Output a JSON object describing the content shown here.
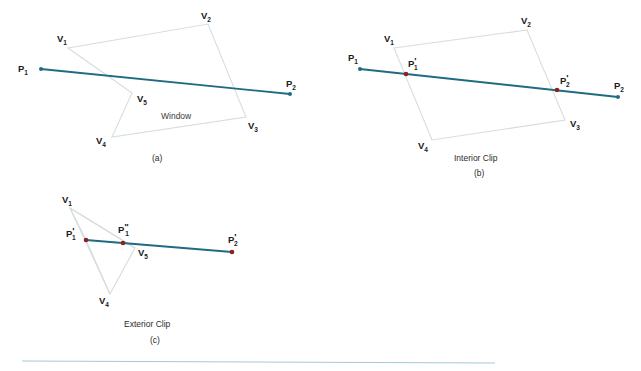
{
  "figure": {
    "colors": {
      "polygon_edge": "#d5dde0",
      "segment": "#1f6b84",
      "endpoint_dot": "#1f6b84",
      "clip_dot": "#8e2020",
      "rule_line": "#a8c6d8",
      "label_text": "#1a1a1a",
      "caption_text": "#2b2b2b",
      "background": "#ffffff"
    },
    "panels": [
      {
        "id": "panel-a",
        "caption": "(a)",
        "title": "",
        "window_label": "Window",
        "vertex_labels": [
          "V",
          "V",
          "V",
          "V",
          "V"
        ],
        "vertex_subscripts": [
          "1",
          "2",
          "3",
          "4",
          "5"
        ],
        "point_labels": [
          "P",
          "P"
        ],
        "point_subscripts": [
          "1",
          "2"
        ],
        "polygon_points": "68,48 208,24 246,117 112,137 132,93",
        "segment": {
          "x1": 41,
          "y1": 69,
          "x2": 290,
          "y2": 94
        }
      },
      {
        "id": "panel-b",
        "caption": "(b)",
        "title": "Interior Clip",
        "window_label": "",
        "vertex_labels": [
          "V",
          "V",
          "V",
          "V"
        ],
        "vertex_subscripts": [
          "1",
          "2",
          "3",
          "4"
        ],
        "point_labels": [
          "P",
          "P",
          "P",
          "P"
        ],
        "point_subscripts": [
          "1",
          "2",
          "1",
          "2"
        ],
        "polygon_points": "394,48 527,30 565,120 432,140",
        "segment": {
          "x1": 360,
          "y1": 69,
          "x2": 618,
          "y2": 97
        },
        "clip_points": [
          {
            "x": 406,
            "y": 74,
            "label": "P",
            "sub": "1",
            "prime": "'"
          },
          {
            "x": 557,
            "y": 90,
            "label": "P",
            "sub": "2",
            "prime": "'"
          }
        ]
      },
      {
        "id": "panel-c",
        "caption": "(c)",
        "title": "Exterior Clip",
        "window_label": "",
        "vertex_labels": [
          "V",
          "V",
          "V"
        ],
        "vertex_subscripts": [
          "1",
          "4",
          "5"
        ],
        "point_labels": [
          "P",
          "P",
          "P"
        ],
        "point_subscripts": [
          "1",
          "1",
          "2"
        ],
        "polygon_points": "70,208 86,240 110,294 135,248",
        "segment": {
          "x1": 86,
          "y1": 240,
          "x2": 232,
          "y2": 252
        },
        "clip_points": [
          {
            "x": 86,
            "y": 240,
            "label": "P",
            "sub": "1",
            "prime": "'"
          },
          {
            "x": 123,
            "y": 243,
            "label": "P",
            "sub": "1",
            "prime": "\""
          },
          {
            "x": 232,
            "y": 252,
            "label": "P",
            "sub": "2",
            "prime": "'"
          }
        ]
      }
    ],
    "rule": {
      "x1": 22,
      "y1": 361,
      "x2": 495,
      "y2": 363
    }
  },
  "labels": {
    "a_V1": "V",
    "a_V1_sub": "1",
    "a_V2": "V",
    "a_V2_sub": "2",
    "a_V3": "V",
    "a_V3_sub": "3",
    "a_V4": "V",
    "a_V4_sub": "4",
    "a_V5": "V",
    "a_V5_sub": "5",
    "a_P1": "P",
    "a_P1_sub": "1",
    "a_P2": "P",
    "a_P2_sub": "2",
    "a_window": "Window",
    "a_caption": "(a)",
    "b_V1": "V",
    "b_V1_sub": "1",
    "b_V2": "V",
    "b_V2_sub": "2",
    "b_V3": "V",
    "b_V3_sub": "3",
    "b_V4": "V",
    "b_V4_sub": "4",
    "b_P1": "P",
    "b_P1_sub": "1",
    "b_P2": "P",
    "b_P2_sub": "2",
    "b_P1p": "P",
    "b_P1p_prime": "'",
    "b_P1p_sub": "1",
    "b_P2p": "P",
    "b_P2p_prime": "'",
    "b_P2p_sub": "2",
    "b_title": "Interior Clip",
    "b_caption": "(b)",
    "c_V1": "V",
    "c_V1_sub": "1",
    "c_V4": "V",
    "c_V4_sub": "4",
    "c_V5": "V",
    "c_V5_sub": "5",
    "c_P1p": "P",
    "c_P1p_prime": "'",
    "c_P1p_sub": "1",
    "c_P1pp": "P",
    "c_P1pp_prime": "\"",
    "c_P1pp_sub": "1",
    "c_P2p": "P",
    "c_P2p_prime": "'",
    "c_P2p_sub": "2",
    "c_title": "Exterior Clip",
    "c_caption": "(c)"
  }
}
